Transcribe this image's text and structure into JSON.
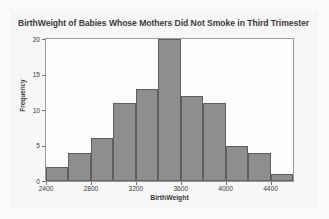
{
  "chart_data": {
    "type": "bar",
    "title": "BirthWeight of Babies Whose Mothers Did Not Smoke in Third Trimester",
    "xlabel": "BirthWeight",
    "ylabel": "Frequency",
    "xlim": [
      2300,
      2500
    ],
    "ylim": [
      0,
      20
    ],
    "grid": false,
    "legend": null,
    "bin_width": 200,
    "bin_starts": [
      2400,
      2600,
      2800,
      3000,
      3200,
      3400,
      3600,
      3800,
      4000,
      4200,
      4400
    ],
    "categories": [
      "2400-2600",
      "2600-2800",
      "2800-3000",
      "3000-3200",
      "3200-3400",
      "3400-3600",
      "3600-3800",
      "3800-4000",
      "4000-4200",
      "4200-4400",
      "4400-4600"
    ],
    "values": [
      2,
      4,
      6,
      11,
      13,
      20,
      12,
      11,
      5,
      4,
      1
    ],
    "x_ticks": [
      2400,
      2800,
      3200,
      3600,
      4000,
      4400
    ],
    "x_tick_labels": [
      "2400",
      "2800",
      "3200",
      "3600",
      "4000",
      "4400"
    ],
    "y_ticks": [
      0,
      5,
      10,
      15,
      20
    ],
    "y_tick_labels": [
      "0",
      "5",
      "10",
      "15",
      "20"
    ],
    "x_axis_min": 2400,
    "x_axis_max": 4600,
    "bar_color": "#8e8e8e",
    "bar_edge_color": "#5f5f5f",
    "plot_background": "#fdfdfd",
    "figure_background": "#f7f7f7",
    "text_color": "#3a3a3a"
  }
}
